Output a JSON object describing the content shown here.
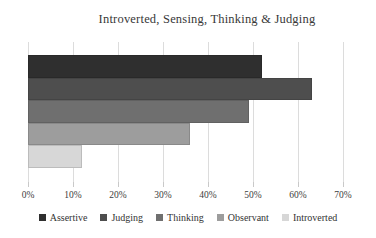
{
  "chart_data": {
    "type": "bar",
    "orientation": "horizontal",
    "title": "Introverted, Sensing, Thinking & Judging",
    "series": [
      {
        "name": "Assertive",
        "value": 52,
        "color": "#2f2f2f"
      },
      {
        "name": "Judging",
        "value": 63,
        "color": "#4e4e4e"
      },
      {
        "name": "Thinking",
        "value": 49,
        "color": "#6f6f6f"
      },
      {
        "name": "Observant",
        "value": 36,
        "color": "#9d9d9d"
      },
      {
        "name": "Introverted",
        "value": 12,
        "color": "#d7d7d7"
      }
    ],
    "xlabel": "",
    "ylabel": "",
    "xlim": [
      0,
      70
    ],
    "x_ticks": [
      "0%",
      "10%",
      "20%",
      "30%",
      "40%",
      "50%",
      "60%",
      "70%"
    ],
    "x_tick_values": [
      0,
      10,
      20,
      30,
      40,
      50,
      60,
      70
    ],
    "values_unit": "%",
    "grid": "vertical",
    "legend_position": "bottom"
  },
  "colors": {
    "background": "#ffffff",
    "gridline": "#dcdcdc",
    "tick": "#c9c9c9",
    "text": "#333333"
  }
}
